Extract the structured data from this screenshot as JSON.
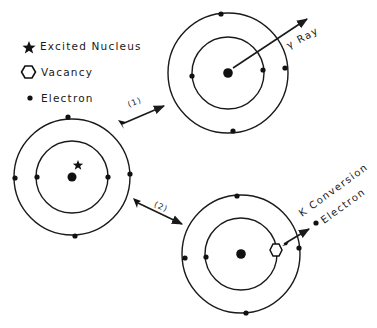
{
  "diagram": {
    "type": "internal conversion vs gamma emission schematic",
    "legend": {
      "items": [
        {
          "symbol": "star-icon",
          "label": "Excited Nucleus"
        },
        {
          "symbol": "hexagon-icon",
          "label": "Vacancy"
        },
        {
          "symbol": "dot-icon",
          "label": "Electron"
        }
      ]
    },
    "atoms": [
      {
        "id": "initial",
        "state": "excited",
        "center": [
          72,
          177
        ],
        "inner_radius": 36,
        "outer_radius": 58,
        "inner_electrons": [
          [
            37,
            177
          ],
          [
            108,
            177
          ]
        ],
        "outer_electrons": [
          [
            15,
            178
          ],
          [
            130,
            174
          ],
          [
            68,
            117
          ],
          [
            75,
            236
          ]
        ]
      },
      {
        "id": "gamma-path",
        "state": "de-excited via gamma emission",
        "center": [
          228,
          73
        ],
        "inner_radius": 36,
        "outer_radius": 60,
        "inner_electrons": [
          [
            192,
            76
          ],
          [
            263,
            70
          ]
        ],
        "outer_electrons": [
          [
            221,
            14
          ],
          [
            285,
            68
          ],
          [
            233,
            131
          ]
        ]
      },
      {
        "id": "conversion-path",
        "state": "de-excited via internal conversion",
        "center": [
          241,
          254
        ],
        "inner_radius": 36,
        "outer_radius": 59,
        "inner_electrons": [
          [
            206,
            257
          ]
        ],
        "vacancy": [
          276,
          250
        ],
        "outer_electrons": [
          [
            237,
            196
          ],
          [
            185,
            258
          ],
          [
            299,
            248
          ],
          [
            246,
            313
          ]
        ]
      }
    ],
    "arrows": [
      {
        "label": "(1)",
        "from": [
          120,
          125
        ],
        "to": [
          165,
          106
        ]
      },
      {
        "label": "(2)",
        "from": [
          135,
          201
        ],
        "to": [
          182,
          223
        ]
      }
    ],
    "annotations": {
      "gamma_ray": "γ Ray",
      "k_conversion_line1": "K Conversion",
      "k_conversion_line2": "Electron"
    }
  }
}
